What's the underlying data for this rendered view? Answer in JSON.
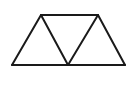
{
  "diagram": {
    "type": "trapezoid-of-triangles",
    "stroke_color": "#1a1a1a",
    "background": "#ffffff",
    "vertices": {
      "top_left": [
        41,
        15
      ],
      "top_right": [
        98,
        15
      ],
      "bottom_left": [
        12,
        65
      ],
      "bottom_mid": [
        68,
        65
      ],
      "bottom_right": [
        125,
        65
      ]
    },
    "edges": [
      [
        "top_left",
        "top_right"
      ],
      [
        "bottom_left",
        "bottom_right"
      ],
      [
        "bottom_left",
        "top_left"
      ],
      [
        "top_left",
        "bottom_mid"
      ],
      [
        "bottom_mid",
        "top_right"
      ],
      [
        "top_right",
        "bottom_right"
      ]
    ]
  }
}
